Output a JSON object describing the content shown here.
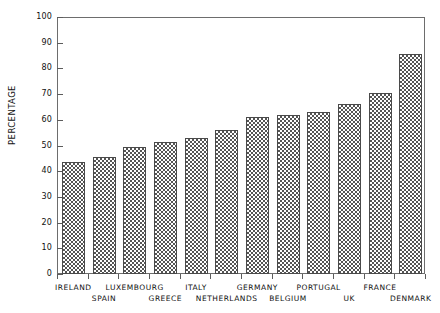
{
  "chart_data": {
    "type": "bar",
    "title": "",
    "xlabel": "",
    "ylabel": "PERCENTAGE",
    "ylim": [
      0,
      100
    ],
    "ytick_step": 10,
    "grid": false,
    "legend": "none",
    "categories": [
      "IRELAND",
      "SPAIN",
      "LUXEMBOURG",
      "GREECE",
      "ITALY",
      "NETHERLANDS",
      "GERMANY",
      "BELGIUM",
      "PORTUGAL",
      "UK",
      "FRANCE",
      "DENMARK"
    ],
    "values": [
      43.5,
      45.5,
      49.5,
      51.5,
      53,
      56,
      61,
      62,
      63,
      66,
      70.5,
      85.5
    ],
    "ytick_labels": [
      "0",
      "10",
      "20",
      "30",
      "40",
      "50",
      "60",
      "70",
      "80",
      "90",
      "100"
    ],
    "bar_fill": "checkerboard",
    "bar_edge_color": "#4a4a4a",
    "axis_color": "#6d6d6d",
    "background_color": "#ffffff"
  }
}
